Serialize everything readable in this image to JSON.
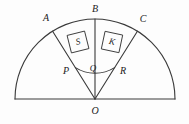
{
  "figure": {
    "width": 189,
    "height": 124,
    "background_color": "#fdfdfd",
    "stroke_color": "#3a3a3a",
    "text_color": "#1b1b1b"
  },
  "geometry": {
    "center": {
      "x": 95,
      "y": 99
    },
    "outer_radius": 80,
    "inner_radius": 37,
    "diameter": {
      "x1": 15,
      "y1": 99,
      "x2": 175,
      "y2": 99
    },
    "rays": [
      {
        "name": "OA",
        "angle_deg": 122,
        "from": "O",
        "to": "A"
      },
      {
        "name": "OB",
        "angle_deg": 90,
        "from": "O",
        "to": "B"
      },
      {
        "name": "OC",
        "angle_deg": 58,
        "from": "O",
        "to": "C"
      }
    ],
    "arcs": [
      {
        "name": "outer-semicircle",
        "radius": 80,
        "start_deg": 0,
        "end_deg": 180
      },
      {
        "name": "inner-arc-PQR",
        "radius": 37,
        "start_deg": 58,
        "end_deg": 122
      }
    ]
  },
  "points": [
    {
      "id": "A",
      "label": "A",
      "x": 49,
      "y": 31,
      "label_x": 46,
      "label_y": 18
    },
    {
      "id": "B",
      "label": "B",
      "x": 95,
      "y": 19,
      "label_x": 95,
      "label_y": 9
    },
    {
      "id": "C",
      "label": "C",
      "x": 137,
      "y": 31,
      "label_x": 143,
      "label_y": 19
    },
    {
      "id": "P",
      "label": "P",
      "x": 75,
      "y": 67,
      "label_x": 66,
      "label_y": 71
    },
    {
      "id": "Q",
      "label": "Q",
      "x": 95,
      "y": 62,
      "label_x": 93,
      "label_y": 68
    },
    {
      "id": "R",
      "label": "R",
      "x": 115,
      "y": 67,
      "label_x": 123,
      "label_y": 71
    },
    {
      "id": "O",
      "label": "O",
      "x": 95,
      "y": 99,
      "label_x": 95,
      "label_y": 111
    }
  ],
  "regions": [
    {
      "id": "S",
      "label": "S",
      "center_x": 78,
      "center_y": 42,
      "box_width": 18,
      "box_height": 18,
      "rotation_deg": -14
    },
    {
      "id": "K",
      "label": "K",
      "center_x": 112,
      "center_y": 42,
      "box_width": 18,
      "box_height": 18,
      "rotation_deg": 12
    }
  ]
}
